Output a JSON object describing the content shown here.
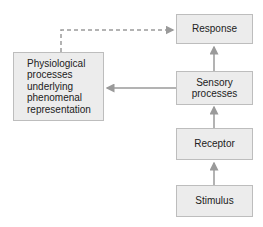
{
  "diagram": {
    "nodes": [
      {
        "id": "response",
        "label": "Response"
      },
      {
        "id": "sensory",
        "label": "Sensory\nprocesses"
      },
      {
        "id": "receptor",
        "label": "Receptor"
      },
      {
        "id": "stimulus",
        "label": "Stimulus"
      },
      {
        "id": "physiological",
        "label": "Physiological\nprocesses\nunderlying\nphenomenal\nrepresentation"
      }
    ],
    "edges": [
      {
        "from": "stimulus",
        "to": "receptor",
        "style": "solid"
      },
      {
        "from": "receptor",
        "to": "sensory",
        "style": "solid"
      },
      {
        "from": "sensory",
        "to": "response",
        "style": "solid"
      },
      {
        "from": "sensory",
        "to": "physiological",
        "style": "solid"
      },
      {
        "from": "physiological",
        "to": "response",
        "style": "dashed"
      }
    ],
    "colors": {
      "box_fill": "#ececec",
      "box_border": "#bdbdbd",
      "arrow": "#9a9a9a",
      "text": "#222222"
    }
  }
}
